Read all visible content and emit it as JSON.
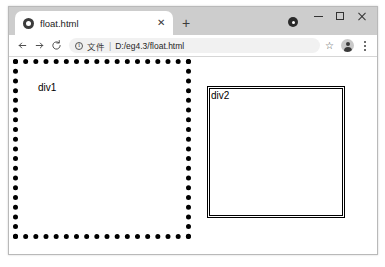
{
  "browser": {
    "tab": {
      "title": "float.html",
      "favicon_name": "globe-favicon",
      "close_label": "✕"
    },
    "new_tab_label": "+",
    "tab_search_name": "tab-search-icon",
    "window_controls": {
      "minimize_label": "",
      "maximize_label": "",
      "close_label": ""
    },
    "toolbar": {
      "back_label": "",
      "forward_label": "",
      "reload_label": "",
      "omnibox": {
        "info_label": "i",
        "scheme": "文件",
        "separator": "|",
        "url": "D:/eg4.3/float.html"
      },
      "star_label": "☆",
      "avatar_name": "profile-avatar",
      "menu_label": ""
    }
  },
  "page": {
    "div1": {
      "label": "div1",
      "border_style": "dotted",
      "border_color": "#000000"
    },
    "div2": {
      "label": "div2",
      "border_style": "double",
      "border_color": "#000000"
    }
  }
}
